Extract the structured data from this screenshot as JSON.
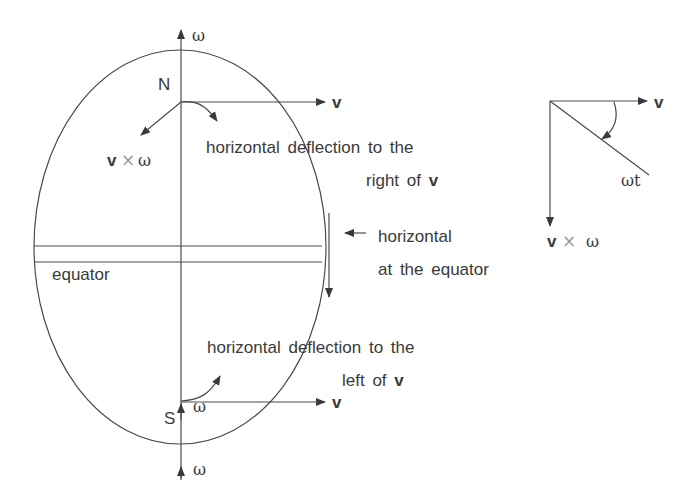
{
  "diagram": {
    "title": "",
    "labels": {
      "north": "N",
      "south": "S",
      "omega_top": "ω",
      "omega_mid": "ω",
      "omega_bottom": "ω",
      "v_north": "v",
      "v_south": "v",
      "v_cross_omega_north_v": "v",
      "v_cross_omega_north_times": "×",
      "v_cross_omega_north_omega": "ω",
      "deflection_right_line1": "horizontal deflection to the",
      "deflection_right_line2_prefix": "right of ",
      "deflection_right_line2_v": "v",
      "equator_horizontal_line1": "horizontal",
      "equator_horizontal_line2": "at the equator",
      "equator": "equator",
      "deflection_left_line1": "horizontal deflection to the",
      "deflection_left_line2_prefix": "left of ",
      "deflection_left_line2_v": "v"
    },
    "inset": {
      "v_label": "v",
      "angle_label": "ωt",
      "cross_v": "v",
      "cross_times": "×",
      "cross_omega": "ω"
    },
    "colors": {
      "line": "#4a4a4a",
      "text": "#3a3a3a",
      "background": "#ffffff"
    }
  }
}
